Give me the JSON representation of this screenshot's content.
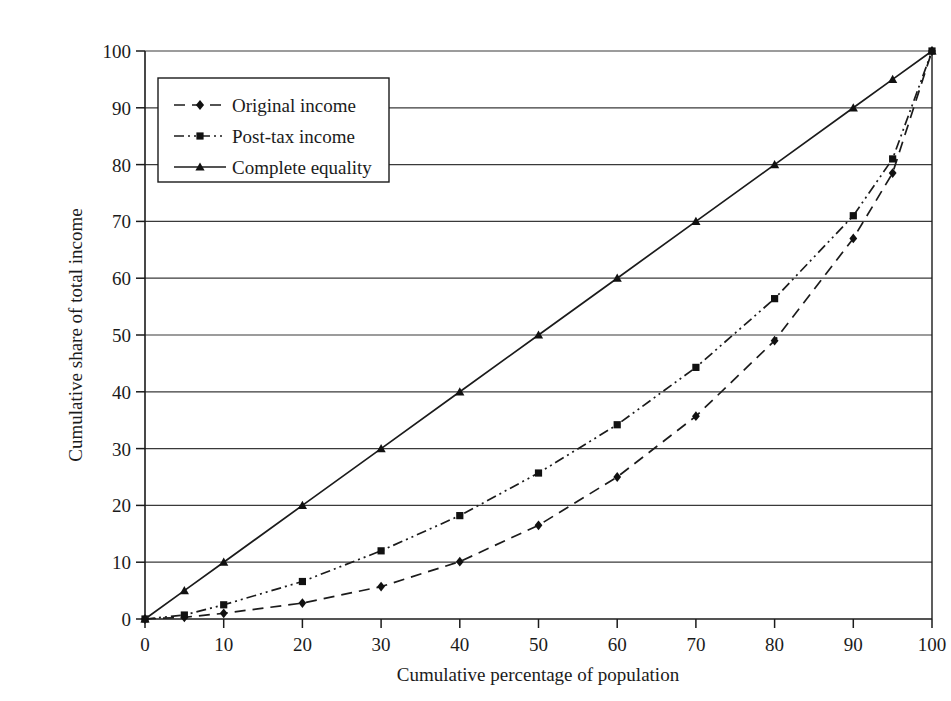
{
  "chart_data": {
    "type": "line",
    "title": "",
    "subtitle": "",
    "xlabel": "Cumulative percentage of population",
    "ylabel": "Cumulative share of total income",
    "xlim": [
      0,
      100
    ],
    "ylim": [
      0,
      100
    ],
    "xticks": [
      0,
      10,
      20,
      30,
      40,
      50,
      60,
      70,
      80,
      90,
      100
    ],
    "yticks": [
      0,
      10,
      20,
      30,
      40,
      50,
      60,
      70,
      80,
      90,
      100
    ],
    "grid": "horizontal",
    "legend_position": "upper-left-inside",
    "x": [
      0,
      5,
      10,
      20,
      30,
      40,
      50,
      60,
      70,
      80,
      90,
      95,
      100
    ],
    "series": [
      {
        "name": "Original income",
        "marker": "diamond",
        "line_style": "dashed",
        "color": "#1b1b1b",
        "values": [
          0,
          0.3,
          1.0,
          2.8,
          5.7,
          10.1,
          16.5,
          25.0,
          35.7,
          49.0,
          67.0,
          78.5,
          100
        ]
      },
      {
        "name": "Post-tax income",
        "marker": "square",
        "line_style": "dash-dot-dot",
        "color": "#1b1b1b",
        "values": [
          0,
          0.7,
          2.5,
          6.6,
          12.0,
          18.2,
          25.7,
          34.2,
          44.3,
          56.4,
          71.0,
          81.0,
          100
        ]
      },
      {
        "name": "Complete equality",
        "marker": "triangle",
        "line_style": "solid",
        "color": "#1b1b1b",
        "values": [
          0,
          5,
          10,
          20,
          30,
          40,
          50,
          60,
          70,
          80,
          90,
          95,
          100
        ]
      }
    ]
  },
  "legend": {
    "items": [
      {
        "label": "Original income"
      },
      {
        "label": "Post-tax income"
      },
      {
        "label": "Complete equality"
      }
    ]
  },
  "axes": {
    "x_title": "Cumulative percentage of population",
    "y_title": "Cumulative share of total income",
    "x_tick_labels": [
      "0",
      "10",
      "20",
      "30",
      "40",
      "50",
      "60",
      "70",
      "80",
      "90",
      "100"
    ],
    "y_tick_labels": [
      "0",
      "10",
      "20",
      "30",
      "40",
      "50",
      "60",
      "70",
      "80",
      "90",
      "100"
    ]
  },
  "colors": {
    "axis": "#1b1b1b",
    "grid": "#3a3a3a",
    "series": "#1b1b1b",
    "background": "#ffffff"
  }
}
